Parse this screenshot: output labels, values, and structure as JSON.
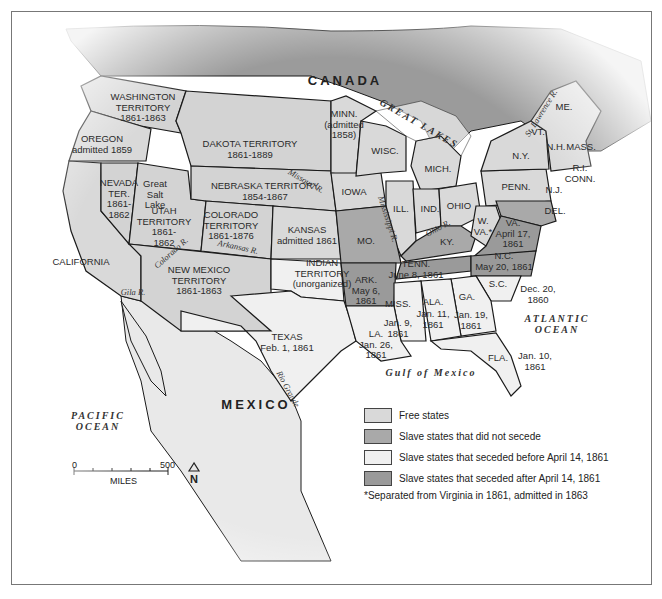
{
  "map": {
    "title_regions": {
      "canada": "CANADA",
      "mexico": "MEXICO",
      "pacific": "PACIFIC\nOCEAN",
      "atlantic": "ATLANTIC\nOCEAN",
      "gulf": "Gulf of Mexico",
      "great_lakes": "GREAT LAKES"
    },
    "colors": {
      "free": "#d9d9d9",
      "slave_not_seceded": "#a9a9a9",
      "seceded_before": "#f0f0f0",
      "seceded_after": "#9a9a9a",
      "canada": "#9b9b9b",
      "territory": "#d3d3d3",
      "border": "#1a1a1a"
    },
    "states": [
      {
        "id": "washington",
        "text": "WASHINGTON\nTERRITORY\n1861-1863",
        "x": 142,
        "y": 107
      },
      {
        "id": "oregon",
        "text": "OREGON\nadmitted 1859",
        "x": 101,
        "y": 143
      },
      {
        "id": "dakota",
        "text": "DAKOTA TERRITORY\n1861-1889",
        "x": 249,
        "y": 148
      },
      {
        "id": "minnesota",
        "text": "MINN.\n(admitted\n1858)",
        "x": 343,
        "y": 124
      },
      {
        "id": "wisconsin",
        "text": "WISC.",
        "x": 384,
        "y": 150
      },
      {
        "id": "michigan",
        "text": "MICH.",
        "x": 437,
        "y": 168
      },
      {
        "id": "newyork",
        "text": "N.Y.",
        "x": 520,
        "y": 155
      },
      {
        "id": "maine",
        "text": "ME.",
        "x": 563,
        "y": 106
      },
      {
        "id": "vermont",
        "text": "VT.",
        "x": 537,
        "y": 131
      },
      {
        "id": "newhampshire",
        "text": "N.H.",
        "x": 555,
        "y": 146
      },
      {
        "id": "massachusetts",
        "text": "MASS.",
        "x": 580,
        "y": 146
      },
      {
        "id": "rhodeisland",
        "text": "R.I.\nCONN.",
        "x": 579,
        "y": 172
      },
      {
        "id": "nevada",
        "text": "NEVADA\nTER.\n1861-\n1862",
        "x": 118,
        "y": 198
      },
      {
        "id": "utah",
        "text": "UTAH\nTERRITORY\n1861-\n1862",
        "x": 163,
        "y": 226
      },
      {
        "id": "greatsaltlake",
        "text": "Great\nSalt\nLake",
        "x": 154,
        "y": 194
      },
      {
        "id": "nebraska",
        "text": "NEBRASKA TERRITORY\n1854-1867",
        "x": 264,
        "y": 190
      },
      {
        "id": "iowa",
        "text": "IOWA",
        "x": 353,
        "y": 191
      },
      {
        "id": "illinois",
        "text": "ILL.",
        "x": 400,
        "y": 208
      },
      {
        "id": "indiana",
        "text": "IND.",
        "x": 429,
        "y": 208
      },
      {
        "id": "ohio",
        "text": "OHIO",
        "x": 458,
        "y": 205
      },
      {
        "id": "pennsylvania",
        "text": "PENN.",
        "x": 515,
        "y": 186
      },
      {
        "id": "newjersey",
        "text": "N.J.",
        "x": 553,
        "y": 189
      },
      {
        "id": "delaware",
        "text": "DEL.",
        "x": 554,
        "y": 210
      },
      {
        "id": "colorado",
        "text": "COLORADO\nTERRITORY\n1861-1876",
        "x": 230,
        "y": 225
      },
      {
        "id": "kansas",
        "text": "KANSAS\nadmitted 1861",
        "x": 306,
        "y": 234
      },
      {
        "id": "missouri",
        "text": "MO.",
        "x": 365,
        "y": 240
      },
      {
        "id": "kentucky",
        "text": "KY.",
        "x": 446,
        "y": 241
      },
      {
        "id": "westvirginia",
        "text": "W.\nVA.*",
        "x": 482,
        "y": 225
      },
      {
        "id": "virginia",
        "text": "VA.\nApril 17,\n1861",
        "x": 512,
        "y": 233
      },
      {
        "id": "california",
        "text": "CALIFORNIA",
        "x": 80,
        "y": 261
      },
      {
        "id": "newmexico",
        "text": "NEW MEXICO\nTERRITORY\n1861-1863",
        "x": 198,
        "y": 280
      },
      {
        "id": "indian",
        "text": "INDIAN\nTERRITORY\n(unorganized)",
        "x": 321,
        "y": 273
      },
      {
        "id": "tennessee",
        "text": "TENN.\nJune 8, 1861",
        "x": 415,
        "y": 268
      },
      {
        "id": "northcarolina",
        "text": "N.C.\nMay 20, 1861",
        "x": 503,
        "y": 260
      },
      {
        "id": "arkansas",
        "text": "ARK.\nMay 6,\n1861",
        "x": 365,
        "y": 290
      },
      {
        "id": "southcarolina",
        "text": "S.C.",
        "x": 497,
        "y": 283
      },
      {
        "id": "sc_date",
        "text": "Dec. 20,\n1860",
        "x": 537,
        "y": 293
      },
      {
        "id": "mississippi",
        "text": "MISS.",
        "x": 397,
        "y": 303
      },
      {
        "id": "alabama",
        "text": "ALA.",
        "x": 432,
        "y": 301
      },
      {
        "id": "georgia",
        "text": "GA.",
        "x": 466,
        "y": 296
      },
      {
        "id": "ms_date",
        "text": "Jan. 9,\n1861",
        "x": 397,
        "y": 327
      },
      {
        "id": "al_date",
        "text": "Jan. 11,\n1861",
        "x": 432,
        "y": 318
      },
      {
        "id": "ga_date",
        "text": "Jan. 19,\n1861",
        "x": 470,
        "y": 319
      },
      {
        "id": "texas",
        "text": "TEXAS\nFeb. 1, 1861",
        "x": 286,
        "y": 341
      },
      {
        "id": "louisiana",
        "text": "LA.\nJan. 26,\n1861",
        "x": 375,
        "y": 344
      },
      {
        "id": "florida",
        "text": "FLA.",
        "x": 497,
        "y": 357
      },
      {
        "id": "fl_date",
        "text": "Jan. 10,\n1861",
        "x": 534,
        "y": 360
      }
    ],
    "rivers": [
      {
        "text": "St. Lawrence R.",
        "x": 540,
        "y": 112,
        "rot": -58
      },
      {
        "text": "Missouri R.",
        "x": 305,
        "y": 180,
        "rot": 30
      },
      {
        "text": "Mississippi R.",
        "x": 387,
        "y": 218,
        "rot": 72
      },
      {
        "text": "Ohio R.",
        "x": 437,
        "y": 227,
        "rot": -28
      },
      {
        "text": "Colorado R.",
        "x": 170,
        "y": 252,
        "rot": -42
      },
      {
        "text": "Arkansas R.",
        "x": 237,
        "y": 246,
        "rot": 12
      },
      {
        "text": "Gila R.",
        "x": 132,
        "y": 291,
        "rot": 0
      },
      {
        "text": "Rio Grande",
        "x": 287,
        "y": 388,
        "rot": 62
      }
    ],
    "scale": {
      "zero": "0",
      "max": "500",
      "unit": "MILES"
    },
    "north": "N"
  },
  "legend": {
    "items": [
      {
        "label": "Free states",
        "color": "#d9d9d9"
      },
      {
        "label": "Slave states that did not secede",
        "color": "#a9a9a9"
      },
      {
        "label": "Slave states that seceded before April 14, 1861",
        "color": "#f0f0f0"
      },
      {
        "label": "Slave states that seceded after April 14, 1861",
        "color": "#9a9a9a"
      }
    ],
    "note": "*Separated from Virginia in 1861, admitted in 1863"
  }
}
